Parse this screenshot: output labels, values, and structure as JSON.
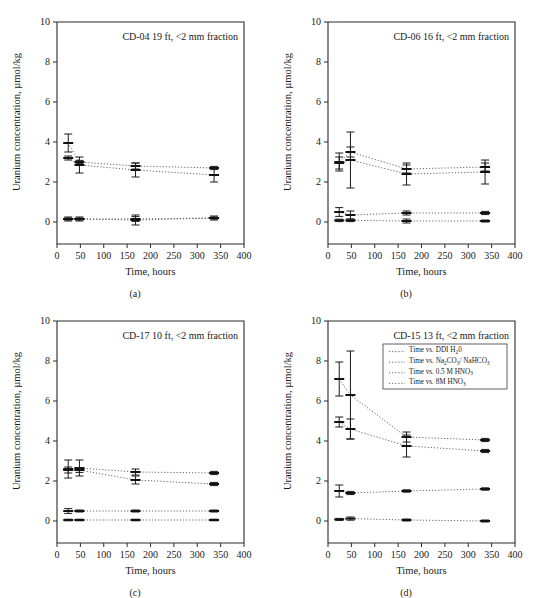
{
  "figure": {
    "background": "#ffffff",
    "ink": "#1a1a1a",
    "panel_count": 4
  },
  "axes": {
    "xlabel": "Time, hours",
    "ylabel": "Uranium concentration, µmol/kg",
    "xlim": [
      0,
      400
    ],
    "ylim": [
      0,
      10
    ],
    "y_axis_bottom_extension": -2.2,
    "xticks": [
      0,
      50,
      100,
      150,
      200,
      250,
      300,
      350,
      400
    ],
    "xticklabels": [
      "0",
      "50",
      "100",
      "150",
      "200",
      "250",
      "300",
      "350",
      "400"
    ],
    "yticks": [
      0,
      2,
      4,
      6,
      8,
      10
    ],
    "yticklabels": [
      "0",
      "2",
      "4",
      "6",
      "8",
      "10"
    ],
    "grid": false
  },
  "legend": {
    "position": "panel-d-upper-right",
    "entries": [
      {
        "label_prefix": "Time vs. DDI H",
        "sub1": "2",
        "label_suffix": "0",
        "marker": "dotted"
      },
      {
        "label_prefix": "Time vs. Na",
        "sub1": "2",
        "mid": "CO",
        "sub2": "3",
        "mid2": "/ NaHCO",
        "sub3": "3",
        "marker": "dotted"
      },
      {
        "label_prefix": "Time vs. 0.5 M HNO",
        "sub1": "3",
        "marker": "dotted"
      },
      {
        "label_prefix": "Time vs. 8M HNO",
        "sub1": "3",
        "marker": "dotted"
      }
    ],
    "plain_labels": [
      "Time vs. DDI H20",
      "Time vs. Na2CO3/ NaHCO3",
      "Time vs. 0.5 M HNO3",
      "Time vs. 8M HNO3"
    ]
  },
  "chart_data": [
    {
      "type": "line",
      "panel": "a",
      "sublabel": "(a)",
      "title": "CD-04 19 ft, <2 mm fraction",
      "xlabel": "Time, hours",
      "ylabel": "Uranium concentration, µmol/kg",
      "xlim": [
        0,
        400
      ],
      "ylim": [
        0,
        10
      ],
      "series": [
        {
          "name": "Time vs. DDI H20",
          "x": [
            24,
            48,
            168,
            336
          ],
          "y": [
            0.15,
            0.15,
            0.1,
            0.2
          ],
          "yerr": [
            0.1,
            0.1,
            0.25,
            0.1
          ]
        },
        {
          "name": "Time vs. Na2CO3/ NaHCO3",
          "x": [
            24,
            48,
            168,
            336
          ],
          "y": [
            3.95,
            3.0,
            2.8,
            2.7
          ],
          "yerr": [
            0.45,
            0.08,
            0.15,
            0.08
          ]
        },
        {
          "name": "Time vs. 0.5 M HNO3",
          "x": [
            24,
            48,
            168,
            336
          ],
          "y": [
            3.2,
            2.85,
            2.6,
            2.35
          ],
          "yerr": [
            0.1,
            0.4,
            0.35,
            0.35
          ]
        },
        {
          "name": "Time vs. 8M HNO3",
          "x": [
            24,
            48,
            168,
            336
          ],
          "y": [
            0.15,
            0.15,
            0.15,
            0.2
          ],
          "yerr": [
            0.05,
            0.05,
            0.12,
            0.05
          ]
        }
      ]
    },
    {
      "type": "line",
      "panel": "b",
      "sublabel": "(b)",
      "title": "CD-06 16 ft, <2 mm fraction",
      "xlabel": "Time, hours",
      "ylabel": "Uranium concentration, µmol/kg",
      "xlim": [
        0,
        400
      ],
      "ylim": [
        0,
        10
      ],
      "series": [
        {
          "name": "Time vs. DDI H20",
          "x": [
            24,
            48,
            168,
            336
          ],
          "y": [
            0.5,
            0.35,
            0.45,
            0.45
          ],
          "yerr": [
            0.22,
            0.2,
            0.1,
            0.08
          ]
        },
        {
          "name": "Time vs. Na2CO3/ NaHCO3",
          "x": [
            24,
            48,
            168,
            336
          ],
          "y": [
            3.0,
            3.5,
            2.65,
            2.75
          ],
          "yerr": [
            0.45,
            0.25,
            0.2,
            0.2
          ]
        },
        {
          "name": "Time vs. 0.5 M HNO3",
          "x": [
            24,
            48,
            168,
            336
          ],
          "y": [
            2.95,
            3.1,
            2.4,
            2.5
          ],
          "yerr": [
            0.3,
            1.4,
            0.55,
            0.6
          ]
        },
        {
          "name": "Time vs. 8M HNO3",
          "x": [
            24,
            48,
            168,
            336
          ],
          "y": [
            0.08,
            0.08,
            0.05,
            0.05
          ],
          "yerr": [
            0.06,
            0.06,
            0.1,
            0.05
          ]
        }
      ]
    },
    {
      "type": "line",
      "panel": "c",
      "sublabel": "(c)",
      "title": "CD-17 10 ft, <2 mm fraction",
      "xlabel": "Time, hours",
      "ylabel": "Uranium concentration, µmol/kg",
      "xlim": [
        0,
        400
      ],
      "ylim": [
        0,
        10
      ],
      "series": [
        {
          "name": "Time vs. DDI H20",
          "x": [
            24,
            48,
            168,
            336
          ],
          "y": [
            0.5,
            0.5,
            0.5,
            0.5
          ],
          "yerr": [
            0.12,
            0.05,
            0.05,
            0.05
          ]
        },
        {
          "name": "Time vs. Na2CO3/ NaHCO3",
          "x": [
            24,
            48,
            168,
            336
          ],
          "y": [
            2.6,
            2.65,
            2.45,
            2.4
          ],
          "yerr": [
            0.45,
            0.4,
            0.15,
            0.08
          ]
        },
        {
          "name": "Time vs. 0.5 M HNO3",
          "x": [
            24,
            48,
            168,
            336
          ],
          "y": [
            2.55,
            2.55,
            2.05,
            1.85
          ],
          "yerr": [
            0.15,
            0.12,
            0.2,
            0.08
          ]
        },
        {
          "name": "Time vs. 8M HNO3",
          "x": [
            24,
            48,
            168,
            336
          ],
          "y": [
            0.05,
            0.05,
            0.05,
            0.05
          ],
          "yerr": [
            0.04,
            0.04,
            0.04,
            0.04
          ]
        }
      ]
    },
    {
      "type": "line",
      "panel": "d",
      "sublabel": "(d)",
      "title": "CD-15 13 ft, <2 mm fraction",
      "xlabel": "Time, hours",
      "ylabel": "Uranium concentration, µmol/kg",
      "xlim": [
        0,
        400
      ],
      "ylim": [
        0,
        10
      ],
      "series": [
        {
          "name": "Time vs. DDI H20",
          "x": [
            24,
            48,
            168,
            336
          ],
          "y": [
            7.1,
            6.3,
            4.2,
            4.05
          ],
          "yerr": [
            0.85,
            2.2,
            0.25,
            0.08
          ]
        },
        {
          "name": "Time vs. Na2CO3/ NaHCO3",
          "x": [
            24,
            48,
            168,
            336
          ],
          "y": [
            4.95,
            4.6,
            3.75,
            3.5
          ],
          "yerr": [
            0.25,
            0.5,
            0.55,
            0.08
          ]
        },
        {
          "name": "Time vs. 0.5 M HNO3",
          "x": [
            24,
            48,
            168,
            336
          ],
          "y": [
            1.5,
            1.4,
            1.5,
            1.6
          ],
          "yerr": [
            0.3,
            0.08,
            0.06,
            0.06
          ]
        },
        {
          "name": "Time vs. 8M HNO3",
          "x": [
            24,
            48,
            168,
            336
          ],
          "y": [
            0.08,
            0.12,
            0.05,
            0.0
          ],
          "yerr": [
            0.05,
            0.08,
            0.05,
            0.05
          ]
        }
      ]
    }
  ]
}
